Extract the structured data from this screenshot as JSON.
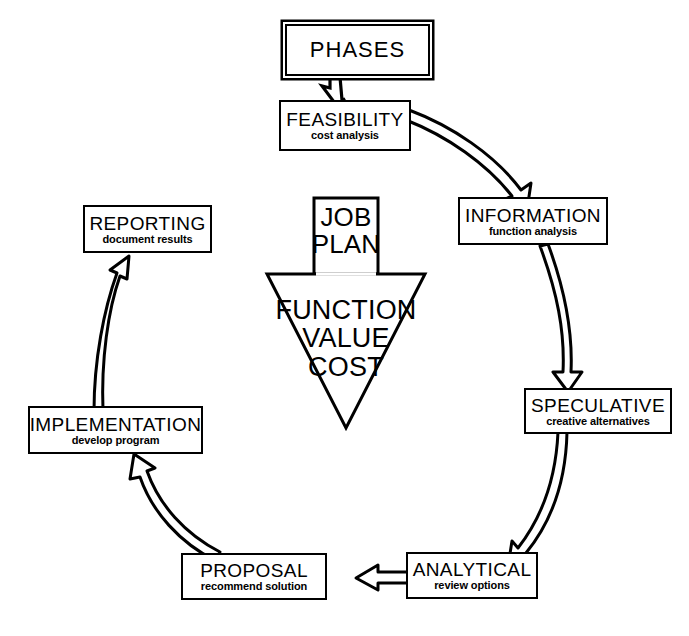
{
  "diagram": {
    "type": "cycle-flow",
    "center": {
      "stem_line_1": "JOB",
      "stem_line_2": "PLAN",
      "triangle_line_1": "FUNCTION",
      "triangle_line_2": "VALUE",
      "triangle_line_3": "COST"
    },
    "header": {
      "label": "PHASES"
    },
    "phases": [
      {
        "id": "feasibility",
        "title": "FEASIBILITY",
        "subtitle": "cost analysis"
      },
      {
        "id": "information",
        "title": "INFORMATION",
        "subtitle": "function analysis"
      },
      {
        "id": "speculative",
        "title": "SPECULATIVE",
        "subtitle": "creative alternatives"
      },
      {
        "id": "analytical",
        "title": "ANALYTICAL",
        "subtitle": "review options"
      },
      {
        "id": "proposal",
        "title": "PROPOSAL",
        "subtitle": "recommend solution"
      },
      {
        "id": "implementation",
        "title": "IMPLEMENTATION",
        "subtitle": "develop program"
      },
      {
        "id": "reporting",
        "title": "REPORTING",
        "subtitle": "document results"
      }
    ],
    "connections": [
      {
        "from": "PHASES",
        "to": "FEASIBILITY"
      },
      {
        "from": "FEASIBILITY",
        "to": "INFORMATION"
      },
      {
        "from": "INFORMATION",
        "to": "SPECULATIVE"
      },
      {
        "from": "SPECULATIVE",
        "to": "ANALYTICAL"
      },
      {
        "from": "ANALYTICAL",
        "to": "PROPOSAL"
      },
      {
        "from": "PROPOSAL",
        "to": "IMPLEMENTATION"
      },
      {
        "from": "IMPLEMENTATION",
        "to": "REPORTING"
      }
    ],
    "colors": {
      "background": "#ffffff",
      "stroke": "#000000",
      "fill": "#ffffff"
    }
  }
}
